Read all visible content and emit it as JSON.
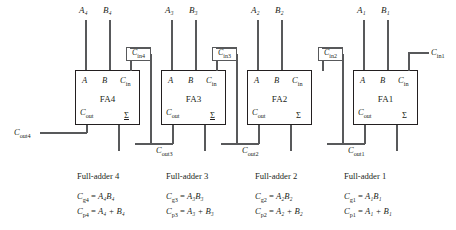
{
  "diagram": {
    "ink_color": "#231f20",
    "wire_color": "#58595b",
    "stages": [
      {
        "block_label": "FA4",
        "input_a": "A₄",
        "input_b": "B₄",
        "pin_a": "A",
        "pin_b": "B",
        "pin_cin": "C",
        "pin_cin_sub": "in",
        "pin_cout": "C",
        "pin_cout_sub": "out",
        "pin_sum": "Σ",
        "carry_in_label": "C",
        "carry_in_sub": "in4",
        "carry_out_label": "C",
        "carry_out_sub": "out4",
        "caption": "Full-adder 4",
        "eq_generate_lhs": "C",
        "eq_generate_lhs_sub": "g4",
        "eq_generate_rhs": "A₄B₄",
        "eq_propagate_lhs": "C",
        "eq_propagate_lhs_sub": "p4",
        "eq_propagate_rhs": "A₄ + B₄"
      },
      {
        "block_label": "FA3",
        "input_a": "A₃",
        "input_b": "B₃",
        "pin_a": "A",
        "pin_b": "B",
        "pin_cin": "C",
        "pin_cin_sub": "in",
        "pin_cout": "C",
        "pin_cout_sub": "out",
        "pin_sum": "Σ",
        "carry_in_label": "C",
        "carry_in_sub": "in3",
        "carry_out_label": "C",
        "carry_out_sub": "out3",
        "caption": "Full-adder 3",
        "eq_generate_lhs": "C",
        "eq_generate_lhs_sub": "g3",
        "eq_generate_rhs": "A₃B₃",
        "eq_propagate_lhs": "C",
        "eq_propagate_lhs_sub": "p3",
        "eq_propagate_rhs": "A₃ + B₃"
      },
      {
        "block_label": "FA2",
        "input_a": "A₂",
        "input_b": "B₂",
        "pin_a": "A",
        "pin_b": "B",
        "pin_cin": "C",
        "pin_cin_sub": "in",
        "pin_cout": "C",
        "pin_cout_sub": "out",
        "pin_sum": "Σ",
        "carry_in_label": "C",
        "carry_in_sub": "in2",
        "carry_out_label": "C",
        "carry_out_sub": "out2",
        "caption": "Full-adder 2",
        "eq_generate_lhs": "C",
        "eq_generate_lhs_sub": "g2",
        "eq_generate_rhs": "A₂B₂",
        "eq_propagate_lhs": "C",
        "eq_propagate_lhs_sub": "p2",
        "eq_propagate_rhs": "A₂ + B₂"
      },
      {
        "block_label": "FA1",
        "input_a": "A₁",
        "input_b": "B₁",
        "pin_a": "A",
        "pin_b": "B",
        "pin_cin": "C",
        "pin_cin_sub": "in",
        "pin_cout": "C",
        "pin_cout_sub": "out",
        "pin_sum": "Σ",
        "carry_in_label": "C",
        "carry_in_sub": "in1",
        "carry_out_label": "C",
        "carry_out_sub": "out1",
        "caption": "Full-adder 1",
        "eq_generate_lhs": "C",
        "eq_generate_lhs_sub": "g1",
        "eq_generate_rhs": "A₁B₁",
        "eq_propagate_lhs": "C",
        "eq_propagate_lhs_sub": "p1",
        "eq_propagate_rhs": "A₁ + B₁"
      }
    ]
  }
}
